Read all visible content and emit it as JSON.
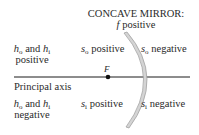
{
  "title": {
    "line1": "CONCAVE MIRROR:",
    "line2_var": "f",
    "line2_text": " positive"
  },
  "regions": {
    "upper_left": {
      "var1": "h",
      "sub1": "o",
      "and": " and ",
      "var2": "h",
      "sub2": "i",
      "line2": "positive"
    },
    "lower_left": {
      "var1": "h",
      "sub1": "o",
      "and": " and ",
      "var2": "h",
      "sub2": "i",
      "line2": "negative"
    },
    "upper_front": {
      "var": "s",
      "sub": "o",
      "text": " positive"
    },
    "upper_back": {
      "var": "s",
      "sub": "o",
      "text": " negative"
    },
    "lower_front": {
      "var": "s",
      "sub": "i",
      "text": " positive"
    },
    "lower_back": {
      "var": "s",
      "sub": "i",
      "text": " negative"
    }
  },
  "axis": {
    "label": "Principal axis"
  },
  "focal_point": {
    "label": "F"
  },
  "colors": {
    "text": "#2a2a2a",
    "axis": "#1a1a1a",
    "mirror_fill": "#d4d4d4",
    "mirror_edge": "#9a9a9a"
  }
}
